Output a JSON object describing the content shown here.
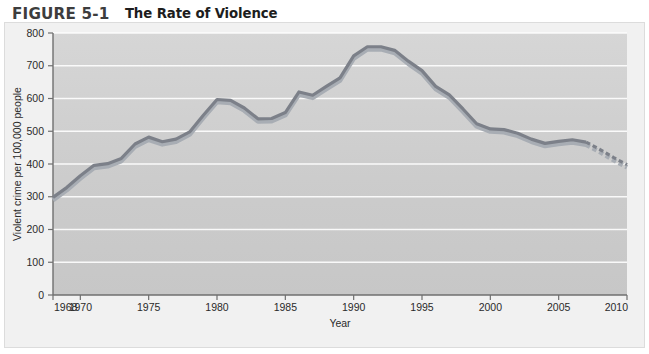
{
  "figure": {
    "number_label": "FIGURE 5-1",
    "title": "The Rate of Violence"
  },
  "colors": {
    "panel_background": "#f1f1f1",
    "plot_background": "#cfcfcf",
    "gridline": "#ffffff",
    "axis": "#6f6f6f",
    "line_dark": "#7c8089",
    "line_light": "#a8adb4",
    "text": "#2a2a2a"
  },
  "chart_data": {
    "type": "line",
    "title": "The Rate of Violence",
    "xlabel": "Year",
    "ylabel": "Violent crime per 100,000 people",
    "xlim": [
      1968,
      2010
    ],
    "ylim": [
      0,
      800
    ],
    "ytick_labels": [
      "0",
      "100",
      "200",
      "300",
      "400",
      "500",
      "600",
      "700",
      "800"
    ],
    "yticks": [
      0,
      100,
      200,
      300,
      400,
      500,
      600,
      700,
      800
    ],
    "xtick_labels": [
      "1968",
      "1970",
      "1975",
      "1980",
      "1985",
      "1990",
      "1995",
      "2000",
      "2005",
      "2010"
    ],
    "xticks": [
      1968,
      1970,
      1975,
      1980,
      1985,
      1990,
      1995,
      2000,
      2005,
      2010
    ],
    "grid": true,
    "legend": "none",
    "series": [
      {
        "name": "Violent crime rate",
        "style": "solid",
        "x": [
          1968,
          1969,
          1970,
          1971,
          1972,
          1973,
          1974,
          1975,
          1976,
          1977,
          1978,
          1979,
          1980,
          1981,
          1982,
          1983,
          1984,
          1985,
          1986,
          1987,
          1988,
          1989,
          1990,
          1991,
          1992,
          1993,
          1994,
          1995,
          1996,
          1997,
          1998,
          1999,
          2000,
          2001,
          2002,
          2003,
          2004,
          2005,
          2006,
          2007
        ],
        "y": [
          298,
          328,
          364,
          396,
          401,
          417,
          461,
          482,
          468,
          476,
          498,
          549,
          597,
          594,
          571,
          538,
          539,
          557,
          620,
          610,
          637,
          663,
          730,
          758,
          758,
          747,
          714,
          685,
          637,
          611,
          568,
          523,
          507,
          505,
          494,
          476,
          463,
          469,
          474,
          467
        ],
        "note": "Reported violent crime per 100,000 people"
      },
      {
        "name": "Projection",
        "style": "dashed",
        "x": [
          2007,
          2008,
          2009,
          2010
        ],
        "y": [
          467,
          445,
          420,
          398
        ],
        "note": "Dashed projected trend, 2007-2010"
      }
    ],
    "annotations": [
      {
        "text": "Peak rate of about 758 per 100,000 reached in 1991-1992"
      },
      {
        "text": "Line is drawn as a shaded double stroke (darker upper edge, lighter lower edge)"
      },
      {
        "text": "Final segment 2007-2010 is rendered as a dashed projection"
      }
    ]
  }
}
